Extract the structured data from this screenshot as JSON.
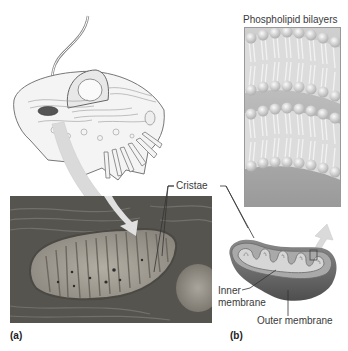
{
  "figure": {
    "panels": [
      {
        "id": "a",
        "label": "(a)"
      },
      {
        "id": "b",
        "label": "(b)"
      }
    ],
    "labels": {
      "phospholipid_bilayers": "Phospholipid bilayers",
      "cristae": "Cristae",
      "inner_membrane_line1": "Inner",
      "inner_membrane_line2": "membrane",
      "outer_membrane": "Outer membrane"
    },
    "colors": {
      "background": "#ffffff",
      "micrograph_dark": "#4a4a48",
      "micrograph_light": "#a8a49c",
      "bilayer_bg": "#b8b8b8",
      "lipid_head": "#e6e6e6",
      "mito_outer": "#6e6e6e",
      "mito_inner": "#c4c4c4",
      "arrow": "#d9d9d9",
      "text": "#3a3a3a"
    }
  }
}
